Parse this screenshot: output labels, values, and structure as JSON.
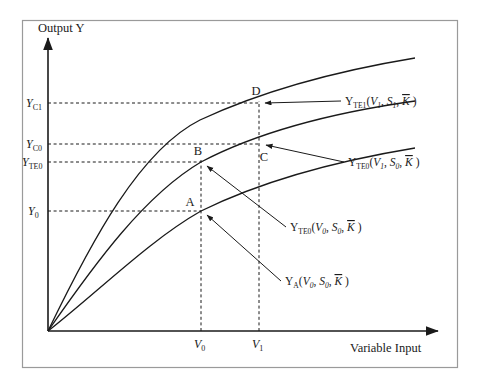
{
  "figure": {
    "title": "",
    "background_color": "#ffffff",
    "line_color": "#1a1a1a",
    "frame_color": "#9a9a9a"
  },
  "axes": {
    "y_title": "Output Y",
    "x_title": "Variable Input",
    "origin": {
      "x": 48,
      "y": 331
    },
    "x_end": 438,
    "y_top": 38
  },
  "y_ticks": [
    {
      "name": "Y_C1",
      "base": "Y",
      "sub": "C1",
      "value_y": 103,
      "label_x": 26
    },
    {
      "name": "Y_C0",
      "base": "Y",
      "sub": "C0",
      "value_y": 144,
      "label_x": 26
    },
    {
      "name": "Y_TE0",
      "base": "Y",
      "sub": "TE0",
      "value_y": 162,
      "label_x": 22
    },
    {
      "name": "Y_0",
      "base": "Y",
      "sub": "0",
      "value_y": 211,
      "label_x": 28
    }
  ],
  "x_ticks": [
    {
      "name": "V_0",
      "base": "V",
      "sub": "0",
      "value_x": 201,
      "label_y": 348
    },
    {
      "name": "V_1",
      "base": "V",
      "sub": "1",
      "value_x": 259,
      "label_y": 348
    }
  ],
  "points": [
    {
      "id": "A",
      "label": "A",
      "x": 201,
      "y": 211,
      "label_dx": -11,
      "label_dy": -5
    },
    {
      "id": "B",
      "label": "B",
      "x": 201,
      "y": 162,
      "label_dx": -3,
      "label_dy": -7
    },
    {
      "id": "C",
      "label": "C",
      "x": 259,
      "y": 144,
      "label_dx": 5,
      "label_dy": 17
    },
    {
      "id": "D",
      "label": "D",
      "x": 259,
      "y": 103,
      "label_dx": -3,
      "label_dy": -8
    }
  ],
  "curves": [
    {
      "name": "frontier-te1-upper",
      "id": "curve_top",
      "path": "M 48 331 C 92 240, 140 150, 200 120 C 260 92, 330 72, 415 58",
      "label": {
        "base": "Y",
        "sub": "TE1",
        "args": [
          {
            "var": "V",
            "sub": "1"
          },
          {
            "var": "S",
            "sub": "1"
          },
          {
            "var": "K",
            "sub": "",
            "bar": true
          }
        ],
        "text": "YTE1(V1, S1, K)",
        "x": 345,
        "y": 105,
        "leader_from": {
          "x": 341,
          "y": 101
        },
        "leader_to": {
          "x": 265,
          "y": 103
        },
        "arrow": true
      }
    },
    {
      "name": "frontier-te0-middle",
      "id": "curve_mid",
      "path": "M 48 331 C 96 262, 145 195, 201 162 C 258 132, 330 113, 415 101",
      "label": {
        "base": "Y",
        "sub": "TE0",
        "args": [
          {
            "var": "V",
            "sub": "1"
          },
          {
            "var": "S",
            "sub": "0"
          },
          {
            "var": "K",
            "sub": "",
            "bar": true
          }
        ],
        "text": "YTE0(V1, S0, K)",
        "x": 348,
        "y": 166,
        "leader_from": {
          "x": 344,
          "y": 162
        },
        "leader_to": {
          "x": 266,
          "y": 145
        },
        "arrow": true
      }
    },
    {
      "name": "actual-output-lower",
      "id": "curve_low",
      "path": "M 48 331 C 100 290, 150 240, 201 211 C 260 182, 330 162, 415 148",
      "label": {
        "base": "Y",
        "sub": "TE0",
        "args": [
          {
            "var": "V",
            "sub": "0"
          },
          {
            "var": "S",
            "sub": "0"
          },
          {
            "var": "K",
            "sub": "",
            "bar": true
          }
        ],
        "text": "YTE0(V0, S0, K)",
        "x": 290,
        "y": 231,
        "leader_from": {
          "x": 286,
          "y": 227
        },
        "leader_to": {
          "x": 207,
          "y": 166
        },
        "arrow": true
      }
    }
  ],
  "annotations": [
    {
      "name": "label-ya",
      "base": "Y",
      "sub": "A",
      "args": [
        {
          "var": "V",
          "sub": "0"
        },
        {
          "var": "S",
          "sub": "0"
        },
        {
          "var": "K",
          "sub": "",
          "bar": true
        }
      ],
      "text": "YA(V0, S0, K)",
      "x": 285,
      "y": 285,
      "leader_from": {
        "x": 281,
        "y": 281
      },
      "leader_to": {
        "x": 207,
        "y": 215
      },
      "arrow": true
    }
  ],
  "guides": [
    {
      "name": "guide-yc1-to-D",
      "type": "horizontal",
      "from_x": 48,
      "to_x": 259,
      "y": 103
    },
    {
      "name": "guide-yc0-to-C",
      "type": "horizontal",
      "from_x": 48,
      "to_x": 259,
      "y": 144
    },
    {
      "name": "guide-yte0-to-B",
      "type": "horizontal",
      "from_x": 48,
      "to_x": 201,
      "y": 162
    },
    {
      "name": "guide-y0-to-A",
      "type": "horizontal",
      "from_x": 48,
      "to_x": 201,
      "y": 211
    },
    {
      "name": "guide-v0-vertical",
      "type": "vertical",
      "x": 201,
      "from_y": 331,
      "to_y": 160
    },
    {
      "name": "guide-v1-vertical",
      "type": "vertical",
      "x": 259,
      "from_y": 331,
      "to_y": 101
    }
  ],
  "chart_data": {
    "type": "line",
    "xlabel": "Variable Input",
    "ylabel": "Output Y",
    "grid": "dashed-guides-only",
    "legend": "inline-annotations",
    "xlim": [
      0,
      1
    ],
    "ylim": [
      0,
      1
    ],
    "x_tick_labels": [
      "V0",
      "V1"
    ],
    "y_tick_labels": [
      "Y0",
      "YTE0",
      "YC0",
      "YC1"
    ],
    "series": [
      {
        "name": "YTE1(V1, S1, K)",
        "description": "Upper production frontier with improved state S1",
        "passes_through": [
          "D"
        ]
      },
      {
        "name": "YTE0(V1, S0, K)",
        "description": "Middle frontier, technically efficient at state S0",
        "passes_through": [
          "B",
          "C"
        ]
      },
      {
        "name": "YA(V0, S0, K) / YTE0(V0, S0, K)",
        "description": "Lower curve showing actual observed output",
        "passes_through": [
          "A"
        ]
      }
    ],
    "annotated_points": [
      {
        "label": "A",
        "x_tick": "V0",
        "y_tick": "Y0"
      },
      {
        "label": "B",
        "x_tick": "V0",
        "y_tick": "YTE0"
      },
      {
        "label": "C",
        "x_tick": "V1",
        "y_tick": "YC0"
      },
      {
        "label": "D",
        "x_tick": "V1",
        "y_tick": "YC1"
      }
    ]
  }
}
